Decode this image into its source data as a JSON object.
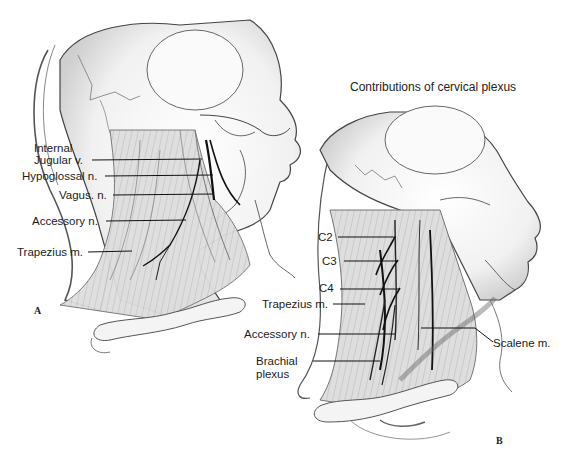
{
  "figure": {
    "title": "Contributions of cervical plexus",
    "panels": [
      {
        "id": "A",
        "letter": "A",
        "labels": [
          {
            "text": "Internal",
            "key": "internal"
          },
          {
            "text": "Jugular v.",
            "key": "jugular"
          },
          {
            "text": "Hypoglossal n.",
            "key": "hypoglossal"
          },
          {
            "text": "Vagus. n.",
            "key": "vagus"
          },
          {
            "text": "Accessory n.",
            "key": "accessory"
          },
          {
            "text": "Trapezius m.",
            "key": "trapezius"
          }
        ]
      },
      {
        "id": "B",
        "letter": "B",
        "labels": [
          {
            "text": "C2",
            "key": "c2"
          },
          {
            "text": "C3",
            "key": "c3"
          },
          {
            "text": "C4",
            "key": "c4"
          },
          {
            "text": "Trapezius m.",
            "key": "trapezius"
          },
          {
            "text": "Accessory n.",
            "key": "accessory"
          },
          {
            "text": "Brachial",
            "key": "brachial"
          },
          {
            "text": "plexus",
            "key": "plexus"
          },
          {
            "text": "Scalene m.",
            "key": "scalene"
          }
        ]
      }
    ]
  },
  "colors": {
    "background": "#ffffff",
    "line": "#1a1a1a",
    "shade": "#bdbdbd"
  }
}
